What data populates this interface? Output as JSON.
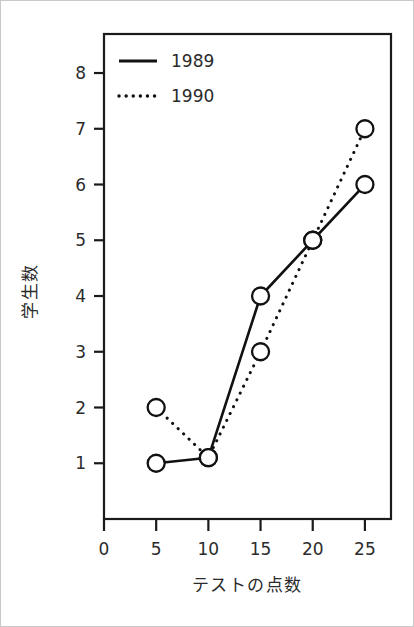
{
  "chart_data": {
    "type": "line",
    "title": "",
    "xlabel": "テストの点数",
    "ylabel": "学生数",
    "x": [
      5,
      10,
      15,
      20,
      25
    ],
    "xlim": [
      0,
      27.5
    ],
    "ylim": [
      0,
      8.7
    ],
    "xticks": [
      0,
      5,
      10,
      15,
      20,
      25
    ],
    "xtick_labels": [
      "0",
      "5",
      "10",
      "15",
      "20",
      "25"
    ],
    "yticks": [
      1,
      2,
      3,
      4,
      5,
      6,
      7,
      8
    ],
    "ytick_labels": [
      "1",
      "2",
      "3",
      "4",
      "5",
      "6",
      "7",
      "8"
    ],
    "grid": false,
    "legend_position": "top-left-inside",
    "marker": "open-circle",
    "series": [
      {
        "name": "1989",
        "linestyle": "solid",
        "color": "#111111",
        "values": [
          1,
          1.1,
          4,
          5,
          6
        ]
      },
      {
        "name": "1990",
        "linestyle": "dotted",
        "color": "#111111",
        "values": [
          2,
          1.1,
          3,
          5,
          7
        ]
      }
    ]
  },
  "legend": {
    "entries": [
      {
        "label": "1989",
        "style": "solid"
      },
      {
        "label": "1990",
        "style": "dotted"
      }
    ]
  },
  "axes": {
    "y_title": "学生数",
    "x_title": "テストの点数"
  }
}
